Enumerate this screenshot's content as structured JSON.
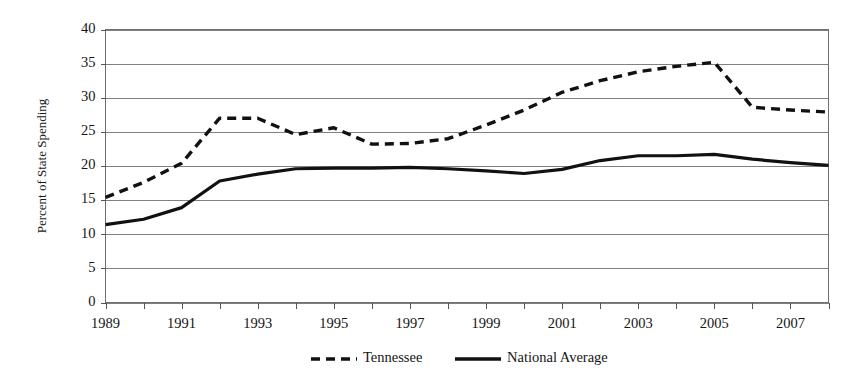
{
  "chart_data": {
    "type": "line",
    "title": "",
    "subtitle": "",
    "xlabel": "",
    "ylabel": "Percent of State Spending",
    "xlim": [
      1989,
      2008
    ],
    "ylim": [
      0,
      40
    ],
    "ytick_step": 5,
    "xtick_step": 1,
    "xlabel_step": 2,
    "grid": "horizontal",
    "legend_position": "bottom-center",
    "x": [
      1989,
      1990,
      1991,
      1992,
      1993,
      1994,
      1995,
      1996,
      1997,
      1998,
      1999,
      2000,
      2001,
      2002,
      2003,
      2004,
      2005,
      2006,
      2007,
      2008
    ],
    "ytick_labels": [
      "0",
      "5",
      "10",
      "15",
      "20",
      "25",
      "30",
      "35",
      "40"
    ],
    "ytick_values": [
      0,
      5,
      10,
      15,
      20,
      25,
      30,
      35,
      40
    ],
    "xtick_values": [
      1989,
      1990,
      1991,
      1992,
      1993,
      1994,
      1995,
      1996,
      1997,
      1998,
      1999,
      2000,
      2001,
      2002,
      2003,
      2004,
      2005,
      2006,
      2007,
      2008
    ],
    "xtick_labels": [
      "1989",
      "",
      "1991",
      "",
      "1993",
      "",
      "1995",
      "",
      "1997",
      "",
      "1999",
      "",
      "2001",
      "",
      "2003",
      "",
      "2005",
      "",
      "2007",
      ""
    ],
    "series": [
      {
        "name": "Tennessee",
        "style": "dashed",
        "color": "#111111",
        "width": 3.4,
        "dash": "9,6",
        "values": [
          15.4,
          17.6,
          20.4,
          27.0,
          27.0,
          24.6,
          25.6,
          23.2,
          23.3,
          24.0,
          26.0,
          28.2,
          30.8,
          32.5,
          33.8,
          34.6,
          35.2,
          28.6,
          28.2,
          27.9
        ]
      },
      {
        "name": "National Average",
        "style": "solid",
        "color": "#111111",
        "width": 3.2,
        "dash": "",
        "values": [
          11.4,
          12.2,
          13.9,
          17.8,
          18.8,
          19.6,
          19.7,
          19.7,
          19.8,
          19.6,
          19.3,
          18.9,
          19.5,
          20.8,
          21.5,
          21.5,
          21.7,
          21.0,
          20.5,
          20.1
        ]
      }
    ]
  },
  "legend": {
    "items": [
      {
        "label": "Tennessee",
        "marker": "dashed-line-swatch"
      },
      {
        "label": "National Average",
        "marker": "solid-line-swatch"
      }
    ]
  },
  "colors": {
    "series": "#111111",
    "grid": "#808080",
    "frame": "#6e6e6e",
    "text": "#151515",
    "background": "#ffffff"
  }
}
